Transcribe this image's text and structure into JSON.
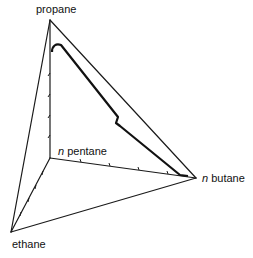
{
  "diagram": {
    "type": "tetrahedral composition diagram",
    "vertices": {
      "propane": {
        "label": "propane",
        "italic_prefix": ""
      },
      "n_pentane": {
        "label": "pentane",
        "italic_prefix": "n"
      },
      "n_butane": {
        "label": "butane",
        "italic_prefix": "n"
      },
      "ethane": {
        "label": "ethane",
        "italic_prefix": ""
      }
    },
    "colors": {
      "line": "#1a1a1a",
      "background": "#ffffff"
    }
  }
}
